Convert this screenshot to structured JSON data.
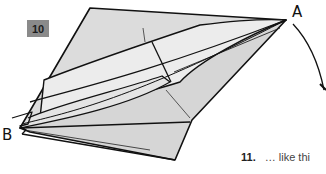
{
  "step": {
    "number": "10"
  },
  "labels": {
    "a": "A",
    "b": "B"
  },
  "next_step": {
    "number": "11.",
    "text": "… like thi"
  },
  "colors": {
    "paper": "#d9d9d9",
    "paper_light": "#e8e8e8",
    "line": "#111111",
    "badge": "#8a8a8a"
  }
}
